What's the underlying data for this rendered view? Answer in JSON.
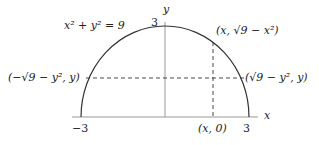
{
  "diagram": {
    "equation": "x² + y² = 9",
    "axis_x_label": "x",
    "axis_y_label": "y",
    "tick_top": "3",
    "tick_left": "−3",
    "tick_right": "3",
    "point_top_right": "(x, √9 − x²)",
    "point_left": "(−√9 − y², y)",
    "point_right": "(√9 − y², y)",
    "point_bottom": "(x, 0)",
    "colors": {
      "curve": "#333333",
      "axis": "#999999",
      "dash": "#333333"
    }
  }
}
